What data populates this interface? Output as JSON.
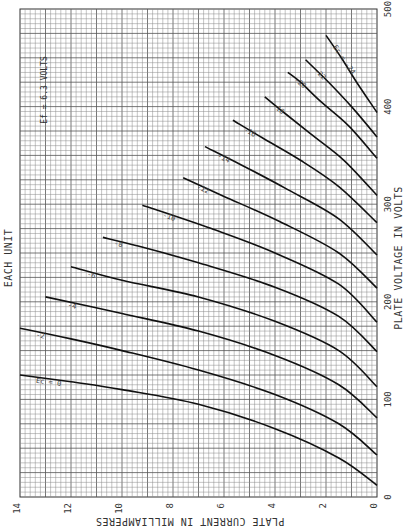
{
  "chart_data": {
    "type": "line",
    "title": "EACH UNIT",
    "annotation": "Ef = 6.3 VOLTS",
    "xlabel": "PLATE VOLTAGE IN VOLTS",
    "ylabel": "PLATE CURRENT IN MILLIAMPERES",
    "xlim": [
      0,
      500
    ],
    "ylim": [
      0,
      14
    ],
    "x_ticks": [
      0,
      100,
      200,
      300,
      400,
      500
    ],
    "y_ticks": [
      0,
      2,
      4,
      6,
      8,
      10,
      12,
      14
    ],
    "grid": true,
    "orientation_note": "page rotated 90 degrees: voltage axis vertical (0 at bottom, 500 at top), current axis horizontal (14 at left, 0 at right)",
    "series": [
      {
        "name": "Ec = 0",
        "label": "Ec = 0",
        "points": [
          [
            12,
            0
          ],
          [
            40,
            1.5
          ],
          [
            70,
            4.0
          ],
          [
            95,
            7.0
          ],
          [
            110,
            10.0
          ],
          [
            118,
            12.0
          ],
          [
            125,
            14.0
          ]
        ]
      },
      {
        "name": "Ec = -2",
        "label": "-2",
        "points": [
          [
            43,
            0
          ],
          [
            75,
            1.5
          ],
          [
            105,
            4.0
          ],
          [
            130,
            7.0
          ],
          [
            150,
            10.0
          ],
          [
            162,
            12.0
          ],
          [
            173,
            14.0
          ]
        ]
      },
      {
        "name": "Ec = -4",
        "label": "-4",
        "points": [
          [
            81,
            0
          ],
          [
            115,
            1.5
          ],
          [
            145,
            4.0
          ],
          [
            170,
            7.0
          ],
          [
            188,
            10.0
          ],
          [
            205,
            13.0
          ]
        ]
      },
      {
        "name": "Ec = -6",
        "label": "-6",
        "points": [
          [
            113,
            0
          ],
          [
            150,
            1.5
          ],
          [
            180,
            4.0
          ],
          [
            205,
            7.0
          ],
          [
            222,
            10.0
          ],
          [
            236,
            12.0
          ]
        ]
      },
      {
        "name": "Ec = -8",
        "label": "-8",
        "points": [
          [
            149,
            0
          ],
          [
            185,
            1.5
          ],
          [
            215,
            4.0
          ],
          [
            240,
            7.0
          ],
          [
            258,
            9.5
          ],
          [
            266,
            10.75
          ]
        ]
      },
      {
        "name": "Ec = -10",
        "label": "-10",
        "points": [
          [
            179,
            0
          ],
          [
            218,
            1.5
          ],
          [
            250,
            4.0
          ],
          [
            275,
            6.5
          ],
          [
            299,
            9.2
          ]
        ]
      },
      {
        "name": "Ec = -12",
        "label": "-12",
        "points": [
          [
            214,
            0
          ],
          [
            250,
            1.5
          ],
          [
            282,
            3.8
          ],
          [
            308,
            6.0
          ],
          [
            327,
            7.6
          ]
        ]
      },
      {
        "name": "Ec = -14",
        "label": "-14",
        "points": [
          [
            248,
            0
          ],
          [
            285,
            1.5
          ],
          [
            315,
            3.5
          ],
          [
            340,
            5.3
          ],
          [
            359,
            6.75
          ]
        ]
      },
      {
        "name": "Ec = -16",
        "label": "-16",
        "points": [
          [
            281,
            0
          ],
          [
            318,
            1.5
          ],
          [
            345,
            3.0
          ],
          [
            368,
            4.5
          ],
          [
            386,
            5.65
          ]
        ]
      },
      {
        "name": "Ec = -18",
        "label": "-18",
        "points": [
          [
            309,
            0
          ],
          [
            345,
            1.3
          ],
          [
            372,
            2.6
          ],
          [
            395,
            3.7
          ],
          [
            410,
            4.4
          ]
        ]
      },
      {
        "name": "Ec = -20",
        "label": "-20",
        "points": [
          [
            347,
            0
          ],
          [
            380,
            1.1
          ],
          [
            405,
            2.2
          ],
          [
            425,
            3.0
          ],
          [
            435,
            3.5
          ]
        ]
      },
      {
        "name": "Ec = -22",
        "label": "-22",
        "points": [
          [
            369,
            0
          ],
          [
            400,
            1.0
          ],
          [
            425,
            1.9
          ],
          [
            448,
            2.8
          ]
        ]
      },
      {
        "name": "Ec = -24",
        "label": "Ec = -24",
        "points": [
          [
            394,
            0
          ],
          [
            425,
            0.8
          ],
          [
            450,
            1.4
          ],
          [
            473,
            2.0
          ]
        ]
      }
    ]
  },
  "labels": {
    "title": "EACH UNIT",
    "annotation": "Ef = 6.3 VOLTS",
    "xlabel": "PLATE VOLTAGE IN VOLTS",
    "ylabel": "PLATE CURRENT IN MILLIAMPERES",
    "first_curve_label": "Ec = 0",
    "last_curve_label": "Ec = -24"
  }
}
